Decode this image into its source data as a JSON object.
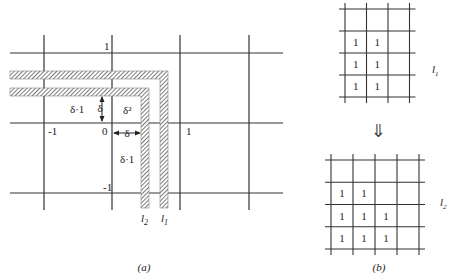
{
  "figure_a": {
    "caption": "(a)",
    "axis_labels": {
      "y_pos": "1",
      "y_neg": "-1",
      "x_neg": "-1",
      "x_pos": "1",
      "origin": "0"
    },
    "region_labels": {
      "delta_1_left": "δ·1",
      "delta_vertical": "δ",
      "delta_squared": "δ²",
      "delta_horizontal": "δ",
      "delta_1_bottom": "δ·1"
    },
    "line_labels": {
      "l2_base": "l",
      "l2_sub": "2",
      "l1_base": "l",
      "l1_sub": "1"
    }
  },
  "figure_b": {
    "caption": "(b)",
    "arrow": "⇓",
    "top_grid": {
      "label_base": "l",
      "label_sub": "1",
      "rows": 4,
      "cols": 3,
      "cells": [
        [
          "",
          "",
          ""
        ],
        [
          "1",
          "1",
          ""
        ],
        [
          "1",
          "1",
          ""
        ],
        [
          "1",
          "1",
          ""
        ]
      ]
    },
    "bottom_grid": {
      "label_base": "l",
      "label_sub": "2",
      "rows": 4,
      "cols": 4,
      "cells": [
        [
          "",
          "",
          "",
          ""
        ],
        [
          "1",
          "1",
          "",
          ""
        ],
        [
          "1",
          "1",
          "1",
          ""
        ],
        [
          "1",
          "1",
          "1",
          ""
        ]
      ]
    }
  }
}
